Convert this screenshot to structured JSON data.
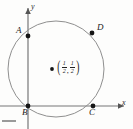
{
  "figure": {
    "type": "coordinate-geometry-diagram",
    "axes": {
      "x_label": "x",
      "y_label": "y"
    },
    "points": [
      {
        "id": "A",
        "label": "A",
        "x_px": 28,
        "y_px": 36,
        "position": "on y-axis, upper left of circle"
      },
      {
        "id": "B",
        "label": "B",
        "x_px": 28,
        "y_px": 106,
        "position": "origin"
      },
      {
        "id": "C",
        "label": "C",
        "x_px": 93,
        "y_px": 106,
        "position": "on x-axis, right"
      },
      {
        "id": "D",
        "label": "D",
        "x_px": 92,
        "y_px": 33,
        "position": "upper right on circle"
      }
    ],
    "center": {
      "marker": "dot",
      "x_num": "1",
      "x_den": "2",
      "y_num": "1",
      "y_den": "2",
      "comma": ",",
      "open_paren": "(",
      "close_paren": ")"
    },
    "circle": {
      "cx_px": 56,
      "cy_px": 69,
      "r_px": 48
    },
    "colors": {
      "stroke": "#8a8a8a",
      "axis": "#707070",
      "point": "#1a1a1a",
      "text": "#222222",
      "background": "#fdfdfc"
    }
  }
}
